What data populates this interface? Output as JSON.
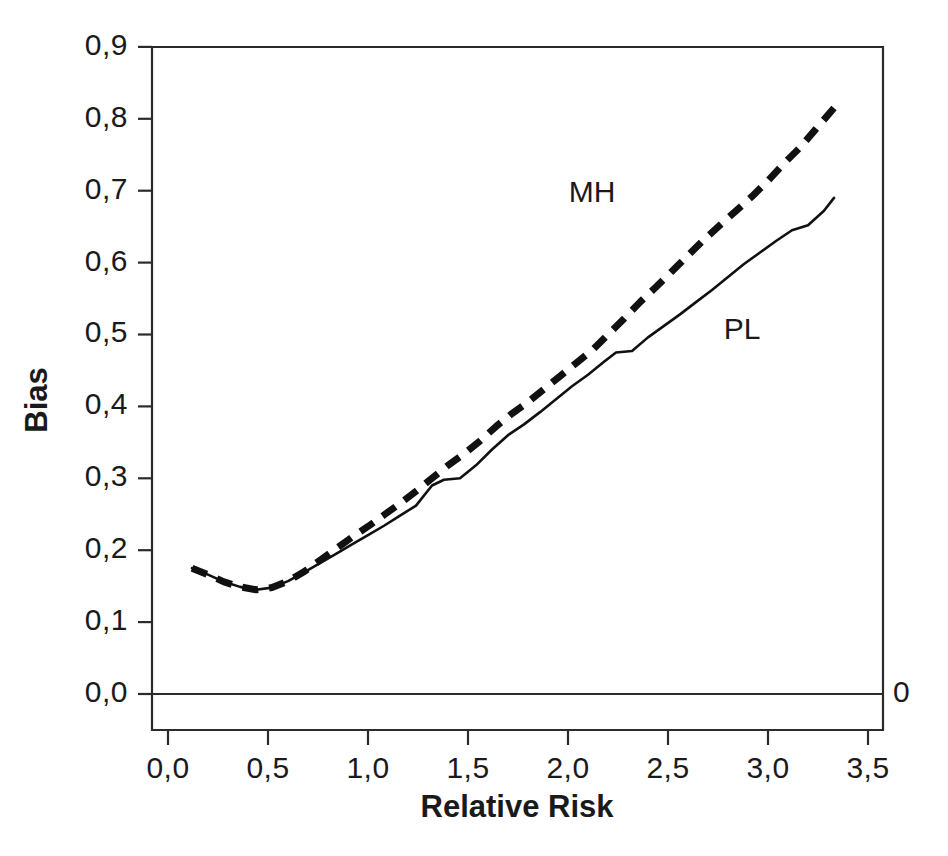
{
  "chart_data": {
    "type": "line",
    "title": "",
    "xlabel": "Relative Risk",
    "ylabel": "Bias",
    "xlim": [
      0.0,
      3.5
    ],
    "ylim": [
      0.0,
      0.9
    ],
    "grid": false,
    "legend_position": "inline-annotation",
    "x_tick_labels": [
      "0,0",
      "0,5",
      "1,0",
      "1,5",
      "2,0",
      "2,5",
      "3,0",
      "3,5"
    ],
    "x_tick_values": [
      0.0,
      0.5,
      1.0,
      1.5,
      2.0,
      2.5,
      3.0,
      3.5
    ],
    "y_tick_labels": [
      "0,0",
      "0,1",
      "0,2",
      "0,3",
      "0,4",
      "0,5",
      "0,6",
      "0,7",
      "0,8",
      "0,9"
    ],
    "y_tick_values": [
      0.0,
      0.1,
      0.2,
      0.3,
      0.4,
      0.5,
      0.6,
      0.7,
      0.8,
      0.9
    ],
    "decimal_separator": ",",
    "annotations": [
      {
        "name": "zero-reference-label",
        "text": "0",
        "x": 3.57,
        "y": 0.0
      }
    ],
    "series": [
      {
        "name": "MH",
        "label": "MH",
        "style": "dashed",
        "stroke": "#111111",
        "label_x": 2.12,
        "label_y": 0.695,
        "x": [
          0.12,
          0.2,
          0.28,
          0.36,
          0.44,
          0.52,
          0.6,
          0.68,
          0.76,
          0.84,
          0.92,
          1.0,
          1.08,
          1.16,
          1.24,
          1.32,
          1.4,
          1.48,
          1.56,
          1.64,
          1.72,
          1.8,
          1.88,
          1.96,
          2.04,
          2.12,
          2.2,
          2.28,
          2.36,
          2.44,
          2.52,
          2.6,
          2.68,
          2.76,
          2.84,
          2.92,
          3.0,
          3.08,
          3.16,
          3.24,
          3.33
        ],
        "values": [
          0.175,
          0.166,
          0.156,
          0.149,
          0.145,
          0.148,
          0.157,
          0.17,
          0.186,
          0.202,
          0.218,
          0.233,
          0.249,
          0.265,
          0.282,
          0.3,
          0.318,
          0.334,
          0.352,
          0.372,
          0.39,
          0.406,
          0.424,
          0.442,
          0.46,
          0.478,
          0.5,
          0.522,
          0.545,
          0.566,
          0.588,
          0.61,
          0.632,
          0.652,
          0.672,
          0.692,
          0.714,
          0.738,
          0.76,
          0.786,
          0.815
        ]
      },
      {
        "name": "PL",
        "label": "PL",
        "style": "solid",
        "stroke": "#111111",
        "label_x": 2.87,
        "label_y": 0.505,
        "x": [
          0.12,
          0.2,
          0.28,
          0.36,
          0.44,
          0.52,
          0.6,
          0.68,
          0.76,
          0.84,
          0.92,
          1.0,
          1.08,
          1.16,
          1.24,
          1.32,
          1.38,
          1.46,
          1.54,
          1.62,
          1.7,
          1.78,
          1.86,
          1.94,
          2.02,
          2.1,
          2.18,
          2.24,
          2.32,
          2.4,
          2.48,
          2.56,
          2.64,
          2.72,
          2.8,
          2.88,
          2.96,
          3.04,
          3.12,
          3.2,
          3.28,
          3.33
        ],
        "values": [
          0.175,
          0.166,
          0.156,
          0.149,
          0.145,
          0.148,
          0.157,
          0.169,
          0.182,
          0.195,
          0.208,
          0.221,
          0.234,
          0.248,
          0.262,
          0.29,
          0.298,
          0.3,
          0.318,
          0.34,
          0.36,
          0.375,
          0.392,
          0.41,
          0.428,
          0.444,
          0.462,
          0.475,
          0.477,
          0.496,
          0.512,
          0.528,
          0.545,
          0.562,
          0.58,
          0.598,
          0.614,
          0.63,
          0.645,
          0.652,
          0.672,
          0.69
        ]
      }
    ]
  },
  "axes": {
    "x_title": "Relative Risk",
    "y_title": "Bias"
  }
}
